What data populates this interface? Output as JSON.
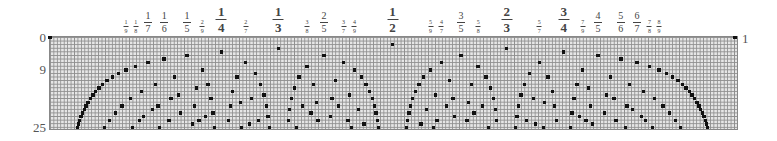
{
  "diagram": {
    "left_labels": [
      {
        "text": "0",
        "row": 0
      },
      {
        "text": "9",
        "row": 9
      },
      {
        "text": "25",
        "row": 25
      }
    ],
    "right_label": {
      "text": "1",
      "row": 0
    },
    "top_fractions": [
      {
        "num": "1",
        "den": "9",
        "value": 0.1111,
        "size": "s"
      },
      {
        "num": "1",
        "den": "8",
        "value": 0.125,
        "size": "s"
      },
      {
        "num": "1",
        "den": "7",
        "value": 0.1429,
        "size": "m"
      },
      {
        "num": "1",
        "den": "6",
        "value": 0.1667,
        "size": "m"
      },
      {
        "num": "1",
        "den": "5",
        "value": 0.2,
        "size": "m"
      },
      {
        "num": "2",
        "den": "9",
        "value": 0.2222,
        "size": "s"
      },
      {
        "num": "1",
        "den": "4",
        "value": 0.25,
        "size": "l"
      },
      {
        "num": "2",
        "den": "7",
        "value": 0.2857,
        "size": "s"
      },
      {
        "num": "1",
        "den": "3",
        "value": 0.3333,
        "size": "l"
      },
      {
        "num": "3",
        "den": "8",
        "value": 0.375,
        "size": "s"
      },
      {
        "num": "2",
        "den": "5",
        "value": 0.4,
        "size": "m"
      },
      {
        "num": "3",
        "den": "7",
        "value": 0.4286,
        "size": "s"
      },
      {
        "num": "4",
        "den": "9",
        "value": 0.4444,
        "size": "s"
      },
      {
        "num": "1",
        "den": "2",
        "value": 0.5,
        "size": "l"
      },
      {
        "num": "5",
        "den": "9",
        "value": 0.5556,
        "size": "s"
      },
      {
        "num": "4",
        "den": "7",
        "value": 0.5714,
        "size": "s"
      },
      {
        "num": "3",
        "den": "5",
        "value": 0.6,
        "size": "m"
      },
      {
        "num": "5",
        "den": "8",
        "value": 0.625,
        "size": "s"
      },
      {
        "num": "2",
        "den": "3",
        "value": 0.6667,
        "size": "l"
      },
      {
        "num": "5",
        "den": "7",
        "value": 0.7143,
        "size": "s"
      },
      {
        "num": "3",
        "den": "4",
        "value": 0.75,
        "size": "l"
      },
      {
        "num": "7",
        "den": "9",
        "value": 0.7778,
        "size": "s"
      },
      {
        "num": "4",
        "den": "5",
        "value": 0.8,
        "size": "m"
      },
      {
        "num": "5",
        "den": "6",
        "value": 0.8333,
        "size": "m"
      },
      {
        "num": "6",
        "den": "7",
        "value": 0.8571,
        "size": "m"
      },
      {
        "num": "7",
        "den": "8",
        "value": 0.875,
        "size": "s"
      },
      {
        "num": "8",
        "den": "9",
        "value": 0.8889,
        "size": "s"
      }
    ],
    "grid": {
      "rows": 25,
      "x0": 50,
      "x1": 735,
      "y0": 37.5,
      "row_height": 3.6,
      "grid_line_color": "#8f8f8f",
      "cell_color": "#e6e6e6",
      "dot_color": "#111111",
      "rule": "row n contains a dot at each reduced fraction k/n (gcd(k,n)=1, 0<k<n); row 0 has dots at 0 and 1"
    }
  }
}
